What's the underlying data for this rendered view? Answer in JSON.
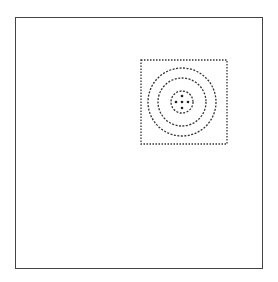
{
  "diagram": {
    "outer_frame": {
      "x": 15,
      "y": 17,
      "width": 248,
      "height": 252,
      "color": "#444444"
    },
    "inner_region": {
      "x": 141,
      "y": 60,
      "width": 86,
      "height": 84,
      "style": "dotted",
      "color": "#333333"
    },
    "center": {
      "x": 182,
      "y": 102
    },
    "rings": [
      {
        "radius": 11,
        "style": "dashed"
      },
      {
        "radius": 24,
        "style": "dashed"
      },
      {
        "radius": 34,
        "style": "dashed"
      }
    ],
    "dots": [
      {
        "dx": 0,
        "dy": -6
      },
      {
        "dx": -6,
        "dy": 0
      },
      {
        "dx": 0,
        "dy": 0
      },
      {
        "dx": 6,
        "dy": 0
      },
      {
        "dx": 0,
        "dy": 6
      }
    ]
  }
}
